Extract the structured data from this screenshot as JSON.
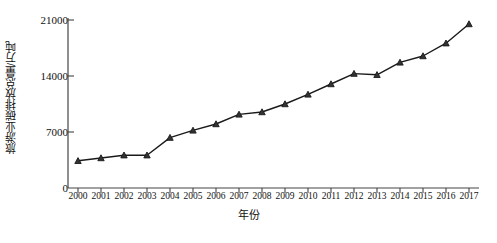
{
  "chart_data": {
    "type": "line",
    "title": "",
    "xlabel": "年份",
    "ylabel": "旅游业碳排放总量/万吨",
    "categories": [
      "2000",
      "2001",
      "2002",
      "2003",
      "2004",
      "2005",
      "2006",
      "2007",
      "2008",
      "2009",
      "2010",
      "2011",
      "2012",
      "2013",
      "2014",
      "2015",
      "2016",
      "2017"
    ],
    "values": [
      3400,
      3750,
      4100,
      4100,
      6300,
      7200,
      8000,
      9200,
      9500,
      10500,
      11700,
      13000,
      14300,
      14150,
      15700,
      16500,
      18100,
      20500
    ],
    "series": [
      {
        "name": "旅游业碳排放总量",
        "values": [
          3400,
          3750,
          4100,
          4100,
          6300,
          7200,
          8000,
          9200,
          9500,
          10500,
          11700,
          13000,
          14300,
          14150,
          15700,
          16500,
          18100,
          20500
        ]
      }
    ],
    "ylim": [
      0,
      21000
    ],
    "yticks": [
      0,
      7000,
      14000,
      21000
    ],
    "ytick_labels": [
      "0",
      "7000",
      "14000",
      "21000"
    ],
    "xlim": [
      "2000",
      "2017"
    ],
    "grid": false,
    "legend": null,
    "marker": "triangle",
    "line_color": "#1a1a1a",
    "marker_color": "#1a1a1a",
    "axis_color": "#444444"
  },
  "axes": {
    "y_axis_title": "旅游业碳排放总量/万吨",
    "x_axis_title": "年份"
  }
}
